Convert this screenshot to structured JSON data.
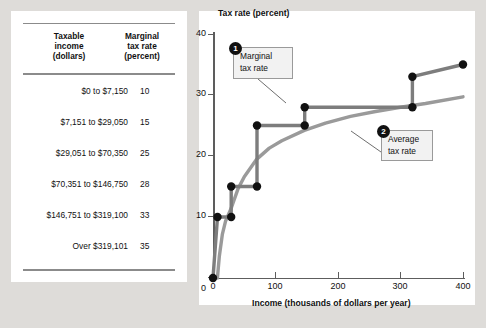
{
  "table": {
    "headers": {
      "income": "Taxable\nincome\n(dollars)",
      "income_l1": "Taxable",
      "income_l2": "income",
      "income_l3": "(dollars)",
      "rate_l1": "Marginal",
      "rate_l2": "tax rate",
      "rate_l3": "(percent)"
    },
    "rows": [
      {
        "bracket": "$0 to $7,150",
        "rate": "10"
      },
      {
        "bracket": "$7,151 to $29,050",
        "rate": "15"
      },
      {
        "bracket": "$29,051 to $70,350",
        "rate": "25"
      },
      {
        "bracket": "$70,351 to $146,750",
        "rate": "28"
      },
      {
        "bracket": "$146,751 to $319,100",
        "rate": "33"
      },
      {
        "bracket": "Over $319,101",
        "rate": "35"
      }
    ]
  },
  "chart_data": {
    "type": "line",
    "title": "",
    "xlabel": "Income (thousands of dollars per year)",
    "ylabel": "Tax rate (percent)",
    "xlim": [
      0,
      400
    ],
    "ylim": [
      0,
      40
    ],
    "xticks": [
      0,
      100,
      200,
      300,
      400
    ],
    "yticks": [
      0,
      10,
      20,
      30,
      40
    ],
    "grid": false,
    "legend": "annotations",
    "series": [
      {
        "name": "Marginal tax rate",
        "color": "#7d7d7d",
        "type": "step",
        "x": [
          0,
          7.15,
          7.15,
          29.05,
          29.05,
          70.35,
          70.35,
          146.75,
          146.75,
          319.1,
          319.1,
          400
        ],
        "y": [
          0,
          0,
          10,
          10,
          15,
          15,
          25,
          25,
          28,
          28,
          33,
          33
        ],
        "step_points": [
          {
            "income": 0,
            "rate": 0
          },
          {
            "income": 7.15,
            "rate": 10
          },
          {
            "income": 29.05,
            "rate": 10
          },
          {
            "income": 29.05,
            "rate": 15
          },
          {
            "income": 70.35,
            "rate": 15
          },
          {
            "income": 70.35,
            "rate": 25
          },
          {
            "income": 146.75,
            "rate": 25
          },
          {
            "income": 146.75,
            "rate": 28
          },
          {
            "income": 319.1,
            "rate": 28
          },
          {
            "income": 319.1,
            "rate": 33
          },
          {
            "income": 400,
            "rate": 35
          }
        ]
      },
      {
        "name": "Average tax rate",
        "color": "#9a9a9a",
        "type": "curve",
        "x": [
          7,
          10,
          15,
          20,
          29,
          40,
          50,
          70,
          90,
          110,
          146,
          180,
          220,
          260,
          300,
          340,
          400
        ],
        "y": [
          0,
          3.5,
          7.2,
          9.3,
          11.4,
          14.6,
          16.6,
          19.5,
          21.3,
          22.5,
          24.2,
          25.4,
          26.5,
          27.3,
          28.0,
          28.6,
          29.7
        ]
      }
    ],
    "annotations": [
      {
        "id": "1",
        "label_l1": "Marginal",
        "label_l2": "tax rate"
      },
      {
        "id": "2",
        "label_l1": "Average",
        "label_l2": "tax rate"
      }
    ]
  }
}
